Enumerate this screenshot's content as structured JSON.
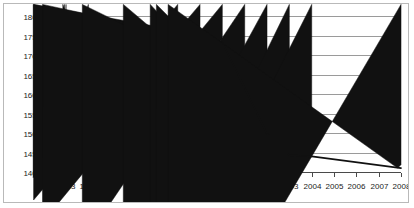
{
  "chart_data": {
    "type": "line",
    "title": "",
    "subtitle": "",
    "xlabel": "",
    "ylabel": "",
    "grid": true,
    "legend": "none",
    "xlim": [
      1993,
      2008
    ],
    "ylim": [
      14000000,
      18000000
    ],
    "x": [
      1993,
      1994,
      1995,
      1996,
      1997,
      1998,
      1999,
      2000,
      2001,
      2002,
      2003,
      2004,
      2005,
      2006,
      2007,
      2008
    ],
    "xtick_labels": [
      "1993",
      "1994",
      "1995",
      "1996",
      "1997",
      "1998",
      "1999",
      "2000",
      "2001",
      "2002",
      "2003",
      "2004",
      "2005",
      "2006",
      "2007",
      "2008"
    ],
    "ytick_values": [
      14000000,
      14500000,
      15000000,
      15500000,
      16000000,
      16500000,
      17000000,
      17500000,
      18000000
    ],
    "ytick_labels": [
      "14000000",
      "14500000",
      "15000000",
      "15500000",
      "16000000",
      "16500000",
      "17000000",
      "17500000",
      "18000000"
    ],
    "series": [
      {
        "name": "series-1-markers",
        "markers": "diamond",
        "x": [
          1993
        ],
        "values": [
          16760000
        ]
      },
      {
        "name": "series-2-markers",
        "markers": "diamond",
        "x": [
          1994,
          1998,
          1999,
          2000,
          2001,
          2002,
          2003,
          2004,
          2008
        ],
        "values": [
          16800000,
          17560000,
          17550000,
          17320000,
          16300000,
          15250000,
          14560000,
          14400000,
          14100000
        ]
      },
      {
        "name": "series-3-plain",
        "markers": "none",
        "x": [
          2000,
          2001,
          2002,
          2003,
          2004
        ],
        "values": [
          17320000,
          16160000,
          14980000,
          14430000,
          14400000
        ]
      }
    ]
  }
}
